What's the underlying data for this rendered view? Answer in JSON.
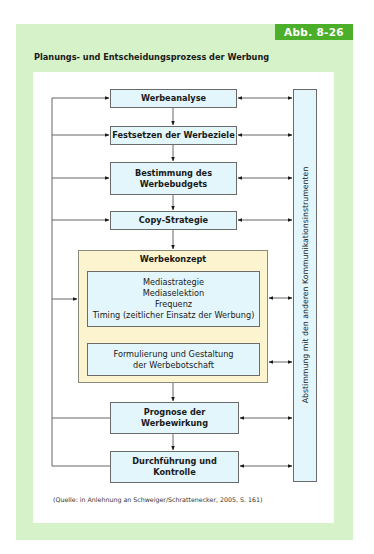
{
  "figure": {
    "badge": "Abb. 8-26",
    "title": "Planungs- und Entscheidungsprozess der Werbung",
    "source": "(Quelle: in Anlehnung an Schweiger/Schrattenecker, 2005, S. 161)",
    "colors": {
      "panel": "#d6f2c8",
      "badge": "#4caf2a",
      "box_fill": "#e2f6fb",
      "konzept_fill": "#fcf3cf"
    }
  },
  "steps": [
    {
      "label": "Werbeanalyse"
    },
    {
      "label": "Festsetzen der Werbeziele"
    },
    {
      "label": "Bestimmung des Werbebudgets"
    },
    {
      "label": "Copy-Strategie"
    },
    {
      "label": "Prognose der Werbewirkung"
    },
    {
      "label": "Durchführung und Kontrolle"
    }
  ],
  "werbekonzept": {
    "title": "Werbekonzept",
    "inner1_lines": [
      "Mediastrategie",
      "Mediaselektion",
      "Frequenz",
      "Timing (zeitlicher Einsatz der Werbung)"
    ],
    "inner2_lines": [
      "Formulierung und Gestaltung",
      "der Werbebotschaft"
    ]
  },
  "side_box": {
    "label": "Abstimmung mit den anderen Kommunikationsinstrumenten"
  }
}
